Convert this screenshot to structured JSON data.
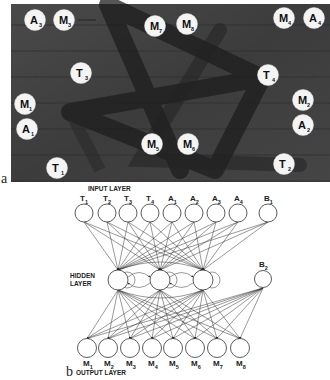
{
  "figure": {
    "panel_a": {
      "label": "a",
      "description": "Photograph of arena floor with star-shaped path and labeled markers",
      "markers": [
        {
          "letter": "A",
          "index": "3",
          "x": 35,
          "y": 20
        },
        {
          "letter": "M",
          "index": "3",
          "x": 64,
          "y": 20
        },
        {
          "letter": "M",
          "index": "7",
          "x": 155,
          "y": 26
        },
        {
          "letter": "M",
          "index": "8",
          "x": 187,
          "y": 24
        },
        {
          "letter": "M",
          "index": "4",
          "x": 284,
          "y": 18
        },
        {
          "letter": "A",
          "index": "4",
          "x": 314,
          "y": 18
        },
        {
          "letter": "T",
          "index": "3",
          "x": 81,
          "y": 73
        },
        {
          "letter": "T",
          "index": "4",
          "x": 268,
          "y": 75
        },
        {
          "letter": "M",
          "index": "1",
          "x": 25,
          "y": 104
        },
        {
          "letter": "M",
          "index": "2",
          "x": 303,
          "y": 100
        },
        {
          "letter": "A",
          "index": "1",
          "x": 27,
          "y": 129
        },
        {
          "letter": "A",
          "index": "2",
          "x": 303,
          "y": 125
        },
        {
          "letter": "M",
          "index": "5",
          "x": 152,
          "y": 144
        },
        {
          "letter": "M",
          "index": "6",
          "x": 188,
          "y": 144
        },
        {
          "letter": "T",
          "index": "1",
          "x": 57,
          "y": 168
        },
        {
          "letter": "T",
          "index": "2",
          "x": 284,
          "y": 164
        }
      ]
    },
    "panel_b": {
      "label": "b",
      "input_layer_label": "INPUT LAYER",
      "hidden_layer_label": [
        "HIDDEN",
        "LAYER"
      ],
      "output_layer_label": "OUTPUT LAYER",
      "input_nodes": [
        {
          "letter": "T",
          "index": "1",
          "x": 84
        },
        {
          "letter": "T",
          "index": "2",
          "x": 107
        },
        {
          "letter": "T",
          "index": "3",
          "x": 128
        },
        {
          "letter": "T",
          "index": "4",
          "x": 150
        },
        {
          "letter": "A",
          "index": "1",
          "x": 172
        },
        {
          "letter": "A",
          "index": "2",
          "x": 194
        },
        {
          "letter": "A",
          "index": "3",
          "x": 216
        },
        {
          "letter": "A",
          "index": "4",
          "x": 238
        }
      ],
      "input_bias": {
        "letter": "B",
        "index": "1",
        "x": 268
      },
      "hidden_nodes": [
        {
          "x": 118
        },
        {
          "x": 160
        },
        {
          "x": 203
        }
      ],
      "hidden_bias": {
        "letter": "B",
        "index": "2",
        "x": 263
      },
      "output_nodes": [
        {
          "letter": "M",
          "index": "1",
          "x": 87
        },
        {
          "letter": "M",
          "index": "2",
          "x": 108
        },
        {
          "letter": "M",
          "index": "3",
          "x": 130
        },
        {
          "letter": "M",
          "index": "4",
          "x": 152
        },
        {
          "letter": "M",
          "index": "5",
          "x": 173
        },
        {
          "letter": "M",
          "index": "6",
          "x": 195
        },
        {
          "letter": "M",
          "index": "7",
          "x": 217
        },
        {
          "letter": "M",
          "index": "8",
          "x": 240
        }
      ]
    }
  }
}
